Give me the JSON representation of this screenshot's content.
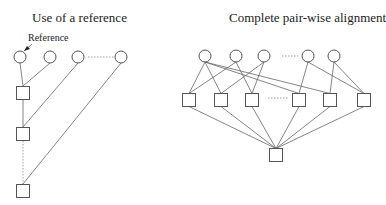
{
  "left": {
    "title": "Use of a reference",
    "reference_label": "Reference",
    "circles": [
      [
        20,
        57
      ],
      [
        50,
        57
      ],
      [
        78,
        57
      ],
      [
        121,
        57
      ]
    ],
    "squares": [
      [
        23,
        93
      ],
      [
        23,
        134
      ],
      [
        23,
        191
      ]
    ],
    "edges": [
      [
        20,
        63,
        23,
        86
      ],
      [
        50,
        63,
        23,
        86
      ],
      [
        23,
        100,
        23,
        127
      ],
      [
        78,
        63,
        23,
        127
      ],
      [
        121,
        63,
        23,
        184
      ]
    ],
    "dotted": [
      [
        88,
        57,
        114,
        57
      ],
      [
        23,
        141,
        23,
        184
      ]
    ],
    "arrow": [
      32,
      44,
      24,
      51
    ]
  },
  "right": {
    "title": "Complete pair-wise alignment",
    "circles": [
      [
        205,
        56
      ],
      [
        236,
        56
      ],
      [
        264,
        56
      ],
      [
        308,
        56
      ],
      [
        334,
        56
      ]
    ],
    "squares": [
      [
        189,
        100
      ],
      [
        221,
        100
      ],
      [
        252,
        100
      ],
      [
        299,
        100
      ],
      [
        330,
        100
      ],
      [
        364,
        100
      ]
    ],
    "bottom_square": [
      276,
      155
    ],
    "dotted": [
      [
        282,
        56,
        298,
        56
      ],
      [
        268,
        98,
        288,
        98
      ]
    ]
  }
}
